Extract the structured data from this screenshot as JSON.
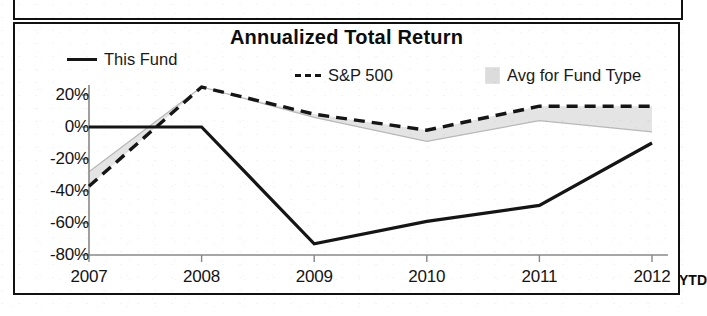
{
  "panel": {
    "title": "Annualized Total Return"
  },
  "legend": {
    "items": [
      {
        "label": "This Fund",
        "swatch": "solid-line-swatch",
        "color": "#151515"
      },
      {
        "label": "S&P 500",
        "swatch": "dashed-line-swatch",
        "color": "#151515"
      },
      {
        "label": "Avg for Fund Type",
        "swatch": "gray-square-swatch",
        "color": "#dcdcdc"
      }
    ]
  },
  "axes": {
    "y_ticks": [
      "20%",
      "0%",
      "-20%",
      "-40%",
      "-60%",
      "-80%"
    ],
    "x_ticks": [
      "2007",
      "2008",
      "2009",
      "2010",
      "2011",
      "2012"
    ],
    "x_suffix": "YTD"
  },
  "chart_data": {
    "type": "line",
    "title": "Annualized Total Return",
    "xlabel": "",
    "ylabel": "",
    "categories": [
      "2007",
      "2008",
      "2009",
      "2010",
      "2011",
      "2012"
    ],
    "ylim": [
      -80,
      20
    ],
    "y_ticks": [
      20,
      0,
      -20,
      -40,
      -60,
      -80
    ],
    "y_tick_labels": [
      "20%",
      "0%",
      "-20%",
      "-40%",
      "-60%",
      "-80%"
    ],
    "grid": false,
    "legend_position": "top",
    "x_axis_note": "2012 YTD",
    "series": [
      {
        "name": "This Fund",
        "style": "solid",
        "color": "#151515",
        "values": [
          0,
          0,
          -73,
          -59,
          -49,
          -10
        ]
      },
      {
        "name": "S&P 500",
        "style": "dashed",
        "color": "#151515",
        "values": [
          -37,
          25,
          8,
          -2,
          13,
          13
        ]
      },
      {
        "name": "Avg for Fund Type",
        "style": "thin-line-with-fill",
        "color": "#b8b8b8",
        "fill": "#e4e4e4",
        "values": [
          -28,
          25,
          6,
          -9,
          4,
          -3
        ]
      }
    ]
  }
}
